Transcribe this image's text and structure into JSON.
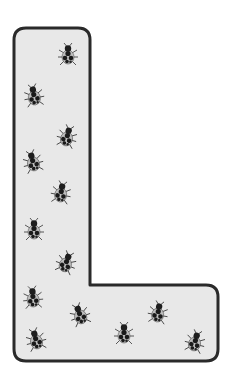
{
  "figure": {
    "shape": "letter-L",
    "fill_color": "#e8e8e8",
    "stroke_color": "#2a2a2a",
    "ladybug_count": 13
  },
  "ladybugs": [
    {
      "x": 68,
      "y": 55,
      "rot": 0
    },
    {
      "x": 34,
      "y": 96,
      "rot": -10
    },
    {
      "x": 67,
      "y": 137,
      "rot": 15
    },
    {
      "x": 33,
      "y": 162,
      "rot": -15
    },
    {
      "x": 61,
      "y": 193,
      "rot": 10
    },
    {
      "x": 34,
      "y": 230,
      "rot": 0
    },
    {
      "x": 66,
      "y": 263,
      "rot": 20
    },
    {
      "x": 33,
      "y": 298,
      "rot": -5
    },
    {
      "x": 80,
      "y": 315,
      "rot": -20
    },
    {
      "x": 158,
      "y": 313,
      "rot": 10
    },
    {
      "x": 124,
      "y": 334,
      "rot": 0
    },
    {
      "x": 36,
      "y": 340,
      "rot": -15
    },
    {
      "x": 195,
      "y": 342,
      "rot": 15
    }
  ]
}
